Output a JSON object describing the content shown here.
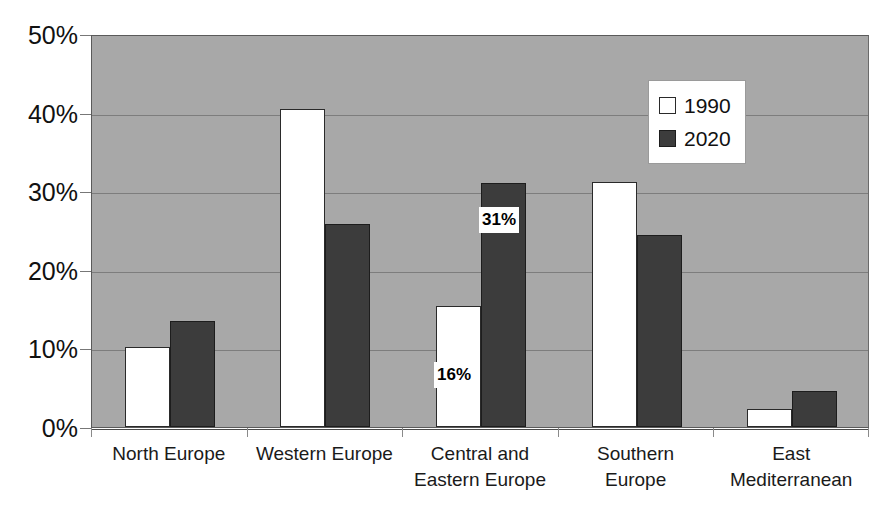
{
  "chart_data": {
    "type": "bar",
    "title": "",
    "xlabel": "",
    "ylabel": "",
    "ylim": [
      0,
      50
    ],
    "y_tick_labels": [
      "0%",
      "10%",
      "20%",
      "30%",
      "40%",
      "50%"
    ],
    "y_tick_values": [
      0,
      10,
      20,
      30,
      40,
      50
    ],
    "grid": true,
    "legend_position": "upper right",
    "categories": [
      "North Europe",
      "Central and Eastern Europe",
      "Western Europe",
      "Southern Europe",
      "East Mediterranean"
    ],
    "category_lines": [
      [
        "North Europe"
      ],
      [
        "Western Europe"
      ],
      [
        "Central and",
        "Eastern Europe"
      ],
      [
        "Southern",
        "Europe"
      ],
      [
        "East",
        "Mediterranean"
      ]
    ],
    "series": [
      {
        "name": "1990",
        "color": "#ffffff",
        "values": [
          10.2,
          40.4,
          15.4,
          31.2,
          2.3
        ]
      },
      {
        "name": "2020",
        "color": "#3c3c3c",
        "values": [
          13.5,
          25.8,
          31.0,
          24.4,
          4.6
        ]
      }
    ],
    "annotations": [
      {
        "text": "16%",
        "series": "1990",
        "category": "Central and Eastern Europe"
      },
      {
        "text": "31%",
        "series": "2020",
        "category": "Central and Eastern Europe"
      }
    ],
    "plot_background_color": "#a8a8a8",
    "gridline_color": "#7d7d7d"
  },
  "legend": {
    "items": [
      {
        "label": "1990",
        "swatch": "hollow-square-swatch"
      },
      {
        "label": "2020",
        "swatch": "filled-square-swatch"
      }
    ]
  }
}
